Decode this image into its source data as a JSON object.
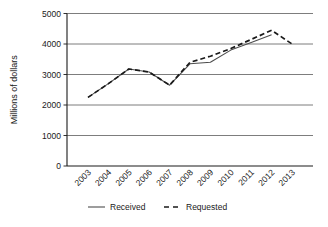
{
  "chart_data": {
    "type": "line",
    "title": "",
    "xlabel": "",
    "ylabel": "Millions of dollars",
    "categories": [
      "2003",
      "2004",
      "2005",
      "2006",
      "2007",
      "2008",
      "2009",
      "2010",
      "2011",
      "2012",
      "2013"
    ],
    "x": [
      2003,
      2004,
      2005,
      2006,
      2007,
      2008,
      2009,
      2010,
      2011,
      2012,
      2013
    ],
    "series": [
      {
        "name": "Received",
        "style": "solid",
        "color": "#4d4d4d",
        "values": [
          2250,
          2700,
          3180,
          3080,
          2650,
          3350,
          3400,
          3800,
          4050,
          4300,
          null
        ]
      },
      {
        "name": "Requested",
        "style": "dashed",
        "color": "#1a1a1a",
        "values": [
          2250,
          2700,
          3180,
          3080,
          2650,
          3400,
          3600,
          3850,
          4150,
          4450,
          4000
        ]
      }
    ],
    "ylim": [
      0,
      5000
    ],
    "yticks": [
      0,
      1000,
      2000,
      3000,
      4000,
      5000
    ],
    "ytick_labels": [
      "0",
      "1000",
      "2000",
      "3000",
      "4000",
      "5000"
    ],
    "grid": true,
    "grid_axis": "y",
    "legend_position": "bottom",
    "xtick_rotation": 45
  },
  "legend": {
    "items": [
      {
        "label": "Received",
        "style": "solid"
      },
      {
        "label": "Requested",
        "style": "dashed"
      }
    ]
  }
}
